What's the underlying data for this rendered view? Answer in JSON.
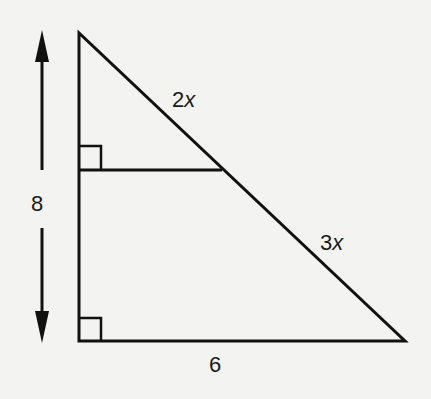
{
  "diagram": {
    "type": "geometry-similar-triangles",
    "labels": {
      "height": "8",
      "upper_hypotenuse_coef": "2",
      "lower_hypotenuse_coef": "3",
      "variable": "x",
      "base": "6"
    },
    "colors": {
      "line": "#111111",
      "background": "#f3f3f2"
    },
    "vertices": {
      "top": [
        79,
        33
      ],
      "bottom_left": [
        79,
        341
      ],
      "bottom_right": [
        405,
        341
      ],
      "midline_right": [
        222,
        170
      ],
      "midline_left": [
        79,
        170
      ]
    },
    "right_angle_markers": [
      "midline-left",
      "bottom-left"
    ],
    "dimension_arrow": {
      "label": "8",
      "direction": "vertical",
      "spans": "full height"
    }
  }
}
